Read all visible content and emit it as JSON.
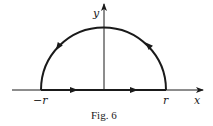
{
  "figure": {
    "caption": "Fig. 6",
    "colors": {
      "ink": "#1a1a1a",
      "background": "#ffffff"
    },
    "axes": {
      "x_label": "x",
      "y_label": "y"
    },
    "contour": {
      "shape": "upper semicircle closed by segment on x-axis",
      "orientation": "counterclockwise",
      "labels": {
        "left_endpoint": "−r",
        "right_endpoint": "r"
      }
    }
  }
}
